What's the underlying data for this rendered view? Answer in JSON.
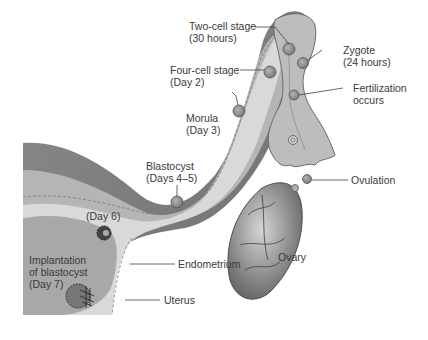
{
  "diagram": {
    "labels": {
      "two_cell_1": "Two-cell stage",
      "two_cell_2": "(30 hours)",
      "zygote_1": "Zygote",
      "zygote_2": "(24 hours)",
      "four_cell_1": "Four-cell stage",
      "four_cell_2": "(Day 2)",
      "fertilization_1": "Fertilization",
      "fertilization_2": "occurs",
      "morula_1": "Morula",
      "morula_2": "(Day 3)",
      "blastocyst_1": "Blastocyst",
      "blastocyst_2": "(Days 4–5)",
      "ovulation": "Ovulation",
      "day6": "(Day 6)",
      "ovary": "Ovary",
      "implantation_1": "Implantation",
      "implantation_2": "of blastocyst",
      "implantation_3": "(Day 7)",
      "endometrium": "Endometrium",
      "uterus": "Uterus"
    },
    "colors": {
      "tissue_dark": "#7a7a7a",
      "tissue_mid": "#a3a3a3",
      "tissue_light": "#c9c9c9",
      "lumen": "#dcdcdc",
      "label_text": "#3a3a3a",
      "leader_line": "#444444"
    }
  }
}
